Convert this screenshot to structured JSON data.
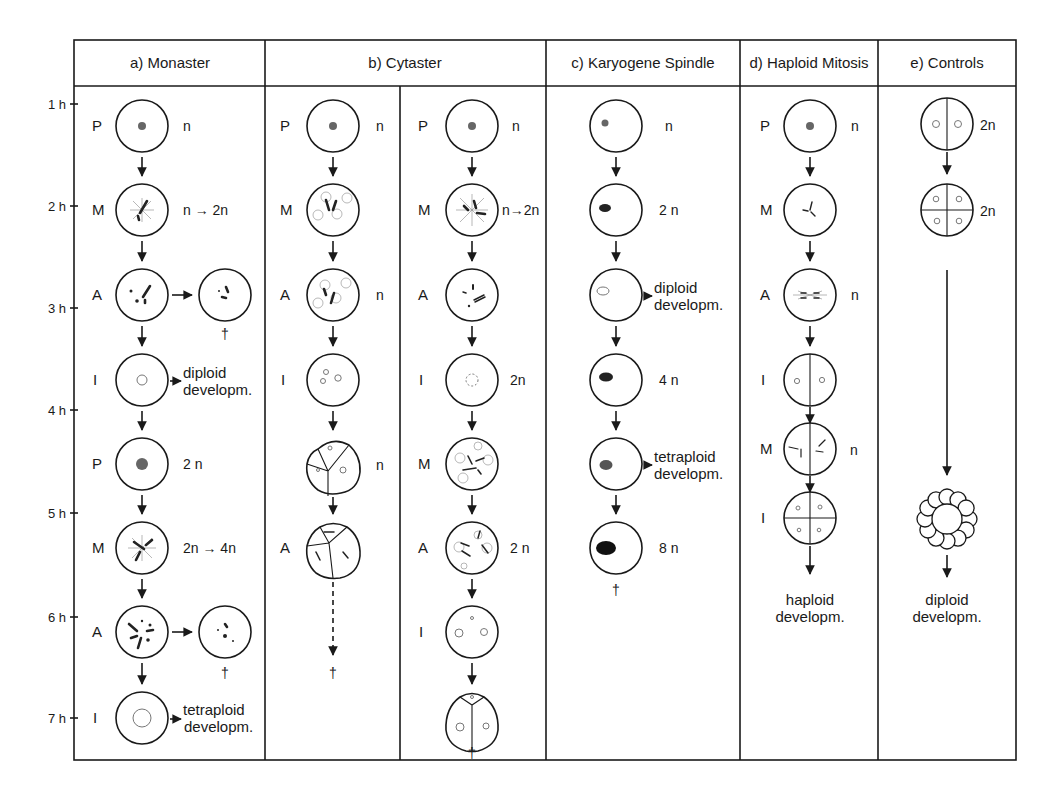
{
  "figure": {
    "columns": [
      {
        "id": "a",
        "label": "a) Monaster"
      },
      {
        "id": "b",
        "label": "b) Cytaster"
      },
      {
        "id": "c",
        "label": "c) Karyogene Spindle"
      },
      {
        "id": "d",
        "label": "d) Haploid Mitosis"
      },
      {
        "id": "e",
        "label": "e) Controls"
      }
    ],
    "time_axis": [
      "1 h",
      "2 h",
      "3 h",
      "4 h",
      "5 h",
      "6 h",
      "7 h"
    ],
    "monaster": {
      "stages": [
        "P",
        "M",
        "A",
        "I",
        "P",
        "M",
        "A",
        "I"
      ],
      "ploidy": [
        "n",
        "n → 2n",
        "2 n",
        "2n → 4n"
      ],
      "outcomes": {
        "diploid_1": "diploid",
        "diploid_2": "developm.",
        "tetraploid_1": "tetraploid",
        "tetraploid_2": "developm.",
        "death_1": "†",
        "death_2": "†"
      }
    },
    "cytaster_left": {
      "stages": [
        "P",
        "M",
        "A",
        "I",
        "A"
      ],
      "ploidy": [
        "n",
        "n",
        "n"
      ],
      "death": "†"
    },
    "cytaster_right": {
      "stages": [
        "P",
        "M",
        "A",
        "I",
        "M",
        "A",
        "I"
      ],
      "ploidy": [
        "n",
        "n→2n",
        "2n",
        "2 n"
      ],
      "death": "†"
    },
    "karyogene": {
      "ploidy": [
        "n",
        "2 n",
        "4 n",
        "8 n"
      ],
      "outcomes": {
        "diploid_1": "diploid",
        "diploid_2": "developm.",
        "tetraploid_1": "tetraploid",
        "tetraploid_2": "developm."
      },
      "death": "†"
    },
    "haploid": {
      "stages": [
        "P",
        "M",
        "A",
        "I",
        "M",
        "I"
      ],
      "ploidy": [
        "n",
        "n",
        "n"
      ],
      "outcome_1": "haploid",
      "outcome_2": "developm."
    },
    "controls": {
      "ploidy": [
        "2n",
        "2n"
      ],
      "outcome_1": "diploid",
      "outcome_2": "developm."
    }
  }
}
